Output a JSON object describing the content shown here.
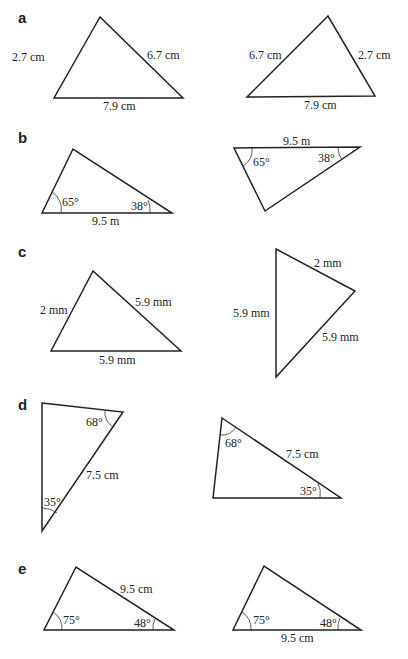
{
  "parts": [
    {
      "letter": "a",
      "left": {
        "sides": [
          "2.7 cm",
          "6.7 cm",
          "7.9 cm"
        ]
      },
      "right": {
        "sides": [
          "6.7 cm",
          "2.7 cm",
          "7.9 cm"
        ]
      }
    },
    {
      "letter": "b",
      "left": {
        "angles": [
          "65°",
          "38°"
        ],
        "sides": [
          "9.5 m"
        ]
      },
      "right": {
        "angles": [
          "65°",
          "38°"
        ],
        "sides": [
          "9.5 m"
        ]
      }
    },
    {
      "letter": "c",
      "left": {
        "sides": [
          "2 mm",
          "5.9 mm",
          "5.9 mm"
        ]
      },
      "right": {
        "sides": [
          "2 mm",
          "5.9 mm",
          "5.9 mm"
        ]
      }
    },
    {
      "letter": "d",
      "left": {
        "angles": [
          "68°",
          "35°"
        ],
        "sides": [
          "7.5 cm"
        ]
      },
      "right": {
        "angles": [
          "68°",
          "35°"
        ],
        "sides": [
          "7.5 cm"
        ]
      }
    },
    {
      "letter": "e",
      "left": {
        "angles": [
          "75°",
          "48°"
        ],
        "sides": [
          "9.5 cm"
        ]
      },
      "right": {
        "angles": [
          "75°",
          "48°"
        ],
        "sides": [
          "9.5 cm"
        ]
      }
    }
  ]
}
